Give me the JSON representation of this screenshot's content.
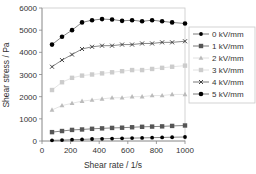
{
  "chart_data": {
    "type": "line",
    "title": "",
    "xlabel": "Shear rate / 1/s",
    "ylabel": "Shear stress / Pa",
    "xlim": [
      0,
      1000
    ],
    "ylim": [
      0,
      6000
    ],
    "x_ticks": [
      0,
      200,
      400,
      600,
      800,
      1000
    ],
    "y_ticks": [
      0,
      1000,
      2000,
      3000,
      4000,
      5000,
      6000
    ],
    "grid": false,
    "legend_position": "right",
    "x": [
      70,
      140,
      210,
      280,
      350,
      420,
      490,
      560,
      630,
      700,
      770,
      840,
      910,
      1000
    ],
    "series": [
      {
        "name": "0 kV/mm",
        "marker": "diamond",
        "color": "#000000",
        "values": [
          30,
          40,
          60,
          70,
          90,
          100,
          110,
          120,
          130,
          140,
          150,
          160,
          170,
          180
        ]
      },
      {
        "name": "1 kV/mm",
        "marker": "square",
        "color": "#555555",
        "values": [
          400,
          450,
          500,
          520,
          550,
          570,
          590,
          600,
          620,
          640,
          650,
          660,
          680,
          700
        ]
      },
      {
        "name": "2 kV/mm",
        "marker": "triangle",
        "color": "#bbbbbb",
        "values": [
          1400,
          1600,
          1700,
          1800,
          1850,
          1900,
          1950,
          1950,
          2000,
          2000,
          2050,
          2050,
          2100,
          2100
        ]
      },
      {
        "name": "3 kV/mm",
        "marker": "square",
        "color": "#cccccc",
        "values": [
          2300,
          2650,
          2850,
          2950,
          3000,
          3050,
          3100,
          3150,
          3200,
          3200,
          3250,
          3300,
          3350,
          3400
        ]
      },
      {
        "name": "4 kV/mm",
        "marker": "x",
        "color": "#444444",
        "values": [
          3350,
          3650,
          3900,
          4150,
          4250,
          4300,
          4300,
          4350,
          4350,
          4400,
          4400,
          4450,
          4450,
          4500
        ]
      },
      {
        "name": "5 kV/mm",
        "marker": "circle",
        "color": "#000000",
        "values": [
          4350,
          4700,
          5000,
          5350,
          5450,
          5500,
          5480,
          5420,
          5450,
          5400,
          5450,
          5400,
          5350,
          5300
        ]
      }
    ]
  }
}
